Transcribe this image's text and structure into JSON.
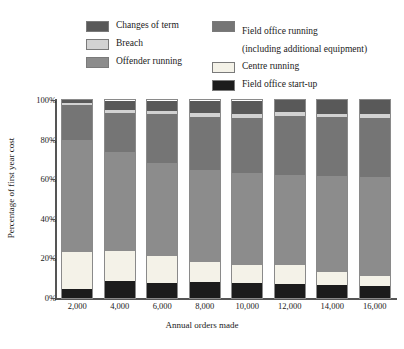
{
  "legend": {
    "left_column": [
      {
        "label": "Changes of term",
        "color": "#595959",
        "key": "changes_of_term"
      },
      {
        "label": "Breach",
        "color": "#d2d2d2",
        "key": "breach"
      },
      {
        "label": "Offender running",
        "color": "#8c8c8c",
        "key": "offender_running"
      }
    ],
    "right_column": [
      {
        "label": "Field office running",
        "sub": "(including additional equipment)",
        "color": "#757575",
        "key": "field_office_running"
      },
      {
        "label": "Centre running",
        "sub": "",
        "color": "#f4f2e8",
        "key": "centre_running"
      },
      {
        "label": "Field office start-up",
        "sub": "",
        "color": "#1c1c1c",
        "key": "field_office_startup"
      }
    ]
  },
  "axes": {
    "y_title": "Percentage of first year cost",
    "x_title": "Annual orders made",
    "y_ticks": [
      "100%",
      "80%",
      "60%",
      "40%",
      "20%",
      "0%"
    ],
    "y_tick_values": [
      100,
      80,
      60,
      40,
      20,
      0
    ],
    "y_min": 0,
    "y_max": 100
  },
  "chart_data": {
    "type": "bar",
    "stacked": true,
    "title": "",
    "xlabel": "Annual orders made",
    "ylabel": "Percentage of first year cost",
    "ylim": [
      0,
      100
    ],
    "grid": false,
    "legend_position": "top",
    "categories": [
      "2,000",
      "4,000",
      "6,000",
      "8,000",
      "10,000",
      "12,000",
      "14,000",
      "16,000"
    ],
    "series": [
      {
        "name": "Field office start-up",
        "color": "#1c1c1c",
        "values": [
          4.5,
          8.5,
          7.5,
          8.0,
          7.5,
          7.0,
          6.5,
          6.0
        ]
      },
      {
        "name": "Centre running",
        "color": "#f4f2e8",
        "values": [
          18.5,
          15.0,
          13.5,
          10.0,
          9.0,
          9.5,
          6.5,
          5.0
        ]
      },
      {
        "name": "Offender running",
        "color": "#8c8c8c",
        "values": [
          57.0,
          50.0,
          47.0,
          46.5,
          46.5,
          45.5,
          48.5,
          50.0
        ]
      },
      {
        "name": "Field office running (including additional equipment)",
        "color": "#757575",
        "values": [
          17.5,
          20.0,
          25.0,
          27.0,
          28.0,
          30.0,
          30.0,
          30.0
        ]
      },
      {
        "name": "Breach",
        "color": "#d2d2d2",
        "values": [
          1.0,
          1.5,
          1.5,
          2.0,
          2.0,
          2.0,
          1.5,
          2.0
        ]
      },
      {
        "name": "Changes of term",
        "color": "#595959",
        "values": [
          1.5,
          4.5,
          5.0,
          6.0,
          6.5,
          6.0,
          7.0,
          7.0
        ]
      }
    ]
  }
}
